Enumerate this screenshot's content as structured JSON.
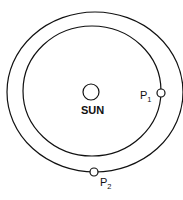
{
  "diagram": {
    "labels": {
      "sun": "SUN",
      "p1_main": "P",
      "p1_sub": "1",
      "p2_main": "P",
      "p2_sub": "2"
    },
    "colors": {
      "stroke": "#111111",
      "background": "#ffffff"
    }
  }
}
